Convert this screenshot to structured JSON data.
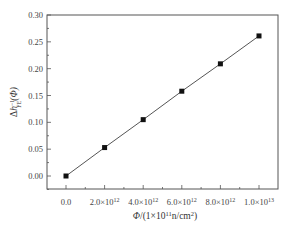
{
  "chart_data": {
    "type": "line",
    "title": "",
    "xlabel": "Φ/(1×10¹¹n/cm²)",
    "xlabel_parts": {
      "main": "Φ/(1×10",
      "sup1": "11",
      "mid": "n/cm",
      "sup2": "2",
      "end": ")"
    },
    "ylabel": "Δh_FE^-1(Φ)",
    "ylabel_parts": {
      "delta": "Δ",
      "h": "h",
      "sup": "−1",
      "sub": "FE",
      "end": "(Φ)"
    },
    "x": [
      0,
      2000000000000.0,
      4000000000000.0,
      6000000000000.0,
      8000000000000.0,
      10000000000000.0
    ],
    "series": [
      {
        "name": "Δh_FE^-1(Φ)",
        "values": [
          0.0,
          0.053,
          0.105,
          0.158,
          0.209,
          0.261
        ],
        "marker": "square",
        "color": "#111111",
        "line_color": "#555555"
      }
    ],
    "xlim": [
      -1500000000000.0,
      11000000000000.0
    ],
    "ylim": [
      -0.025,
      0.3
    ],
    "x_ticks": [
      {
        "value": 0,
        "label": "0.0",
        "base": "",
        "exp": ""
      },
      {
        "value": 2000000000000.0,
        "label": "2.0×10¹²",
        "base": "2.0×10",
        "exp": "12"
      },
      {
        "value": 4000000000000.0,
        "label": "4.0×10¹²",
        "base": "4.0×10",
        "exp": "12"
      },
      {
        "value": 6000000000000.0,
        "label": "6.0×10¹²",
        "base": "6.0×10",
        "exp": "12"
      },
      {
        "value": 8000000000000.0,
        "label": "8.0×10¹²",
        "base": "8.0×10",
        "exp": "12"
      },
      {
        "value": 10000000000000.0,
        "label": "1.0×10¹³",
        "base": "1.0×10",
        "exp": "13"
      }
    ],
    "y_ticks": [
      {
        "value": 0.0,
        "label": "0.00"
      },
      {
        "value": 0.05,
        "label": "0.05"
      },
      {
        "value": 0.1,
        "label": "0.10"
      },
      {
        "value": 0.15,
        "label": "0.15"
      },
      {
        "value": 0.2,
        "label": "0.20"
      },
      {
        "value": 0.25,
        "label": "0.25"
      },
      {
        "value": 0.3,
        "label": "0.30"
      }
    ],
    "grid": false,
    "legend": null
  }
}
